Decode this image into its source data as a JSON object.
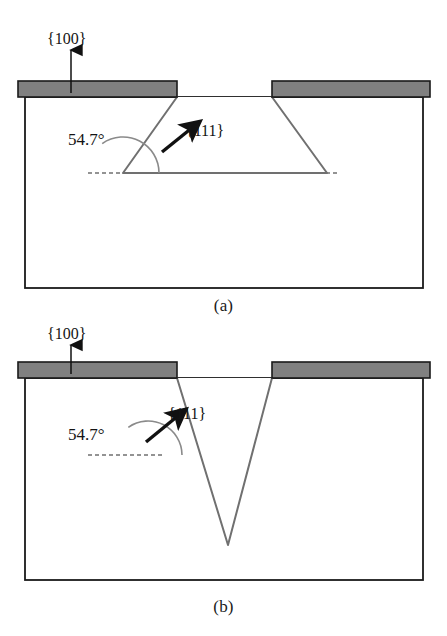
{
  "figure": {
    "type": "technical-diagram",
    "panels": [
      {
        "id": "a",
        "caption": "(a)",
        "profile": "trapezoidal-trench",
        "labels": {
          "surface_plane": "{100}",
          "sidewall_plane": "{111}",
          "sidewall_angle": "54.7°"
        }
      },
      {
        "id": "b",
        "caption": "(b)",
        "profile": "v-groove",
        "labels": {
          "surface_plane": "{100}",
          "sidewall_plane": "{111}",
          "sidewall_angle": "54.7°"
        }
      }
    ]
  },
  "colors": {
    "mask_fill": "#808080",
    "mask_stroke": "#1a1a1a",
    "substrate_stroke": "#1a1a1a",
    "etch_wall_stroke": "#707070",
    "dashed_reference": "#707070",
    "arrow_fill": "#111111",
    "background": "#ffffff"
  },
  "geometry": {
    "panel_a": {
      "substrate_box": {
        "x": 25,
        "y": 97,
        "width": 398,
        "height": 191
      },
      "mask_left": {
        "x": 18,
        "y": 81,
        "width": 159,
        "height": 16
      },
      "mask_right": {
        "x": 272,
        "y": 81,
        "width": 158,
        "height": 16
      },
      "trench_bottom_y": 173,
      "wall_left": {
        "x1": 177,
        "y1": 97,
        "x2": 123,
        "y2": 173
      },
      "wall_right": {
        "x1": 272,
        "y1": 97,
        "x2": 327,
        "y2": 173
      },
      "bottom_flat": {
        "x1": 123,
        "y1": 173,
        "x2": 327,
        "y2": 173
      },
      "dashed_line": {
        "x1": 88,
        "y1": 173,
        "x2": 340,
        "y2": 173
      },
      "angle_vertex": {
        "x": 123,
        "y": 173
      },
      "angle_arc_radius": 36,
      "normal_arrow": {
        "x1": 162,
        "y1": 152,
        "x2": 196,
        "y2": 125
      },
      "up_arrow": {
        "x": 71,
        "y1": 93,
        "y2": 48
      }
    },
    "panel_b": {
      "substrate_box": {
        "x": 25,
        "y": 378,
        "width": 398,
        "height": 202
      },
      "mask_left": {
        "x": 18,
        "y": 362,
        "width": 159,
        "height": 16
      },
      "mask_right": {
        "x": 272,
        "y": 362,
        "width": 158,
        "height": 16
      },
      "apex": {
        "x": 228,
        "y": 545
      },
      "wall_left": {
        "x1": 177,
        "y1": 378,
        "x2": 228,
        "y2": 545
      },
      "wall_right": {
        "x1": 272,
        "y1": 378,
        "x2": 228,
        "y2": 545
      },
      "dashed_line": {
        "x1": 88,
        "y1": 455,
        "x2": 162,
        "y2": 455
      },
      "angle_vertex": {
        "x": 148,
        "y": 455
      },
      "angle_arc_radius": 34,
      "normal_arrow": {
        "x1": 148,
        "y1": 443,
        "x2": 182,
        "y2": 413
      },
      "up_arrow": {
        "x": 71,
        "y1": 374,
        "y2": 343
      }
    }
  }
}
